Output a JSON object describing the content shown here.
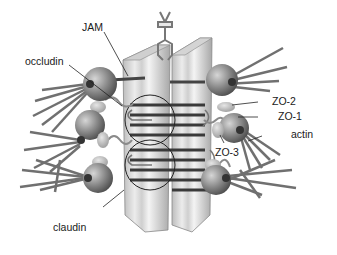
{
  "diagram": {
    "labels": {
      "jam": "JAM",
      "occludin": "occludin",
      "zo2": "ZO-2",
      "zo1": "ZO-1",
      "actin": "actin",
      "zo3": "ZO-3",
      "claudin": "claudin"
    },
    "colors": {
      "membrane_light": "#d9d9d9",
      "membrane_stripe": "#f2f2f2",
      "membrane_dark": "#9a9a9a",
      "sphere": "#7a7a7a",
      "sphere_light": "#c8c8c8",
      "actin": "#6e6e6e",
      "text": "#1a1a1a",
      "line": "#222222"
    }
  }
}
